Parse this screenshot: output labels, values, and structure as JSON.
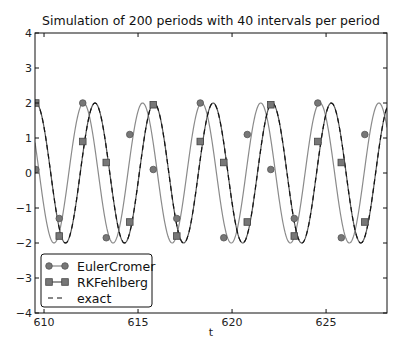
{
  "chart_data": {
    "type": "line",
    "title": "Simulation of 200 periods with 40 intervals per period",
    "xlabel": "t",
    "ylabel": "",
    "xlim": [
      609.52,
      628.24
    ],
    "ylim": [
      -4,
      4
    ],
    "xticks": [
      610,
      615,
      620,
      625
    ],
    "xtick_labels": [
      "610",
      "615",
      "620",
      "625"
    ],
    "yticks": [
      4,
      3,
      2,
      1,
      0,
      -1,
      -2,
      -3,
      -4
    ],
    "ytick_labels": [
      "4",
      "3",
      "2",
      "1",
      "0",
      "−1",
      "−2",
      "−3",
      "−4"
    ],
    "grid": false,
    "legend_position": "lower left",
    "series": [
      {
        "name": "EulerCromer",
        "style": "solid line with circle markers",
        "color": "#888888",
        "amplitude": 2,
        "angular_frequency": 2,
        "peak_t": 608.96,
        "marker_t": [
          609.56,
          610.81,
          612.06,
          613.31,
          614.56,
          615.81,
          617.06,
          618.31,
          619.56,
          620.81,
          622.06,
          623.31,
          624.56,
          625.81,
          627.06
        ],
        "marker_y": [
          0.1,
          -1.3,
          2.0,
          -1.85,
          1.1,
          0.1,
          -1.3,
          2.0,
          -1.85,
          1.1,
          0.1,
          -1.3,
          2.0,
          -1.85,
          1.1
        ]
      },
      {
        "name": "RKFehlberg",
        "style": "solid line with square markers",
        "color": "#555555",
        "amplitude": 2,
        "angular_frequency": 2,
        "peak_t": 609.57,
        "marker_t": [
          609.56,
          610.81,
          612.06,
          613.31,
          614.56,
          615.81,
          617.06,
          618.31,
          619.56,
          620.81,
          622.06,
          623.31,
          624.56,
          625.81,
          627.06
        ],
        "marker_y": [
          2.0,
          -1.8,
          0.9,
          0.3,
          -1.4,
          1.95,
          -1.8,
          0.9,
          0.3,
          -1.4,
          1.95,
          -1.8,
          0.9,
          0.3,
          -1.4
        ]
      },
      {
        "name": "exact",
        "style": "dashed line",
        "color": "#111111",
        "amplitude": 2,
        "angular_frequency": 2,
        "peak_t": 609.57
      }
    ]
  },
  "legend": {
    "items": [
      {
        "label": "EulerCromer"
      },
      {
        "label": "RKFehlberg"
      },
      {
        "label": "exact"
      }
    ]
  }
}
